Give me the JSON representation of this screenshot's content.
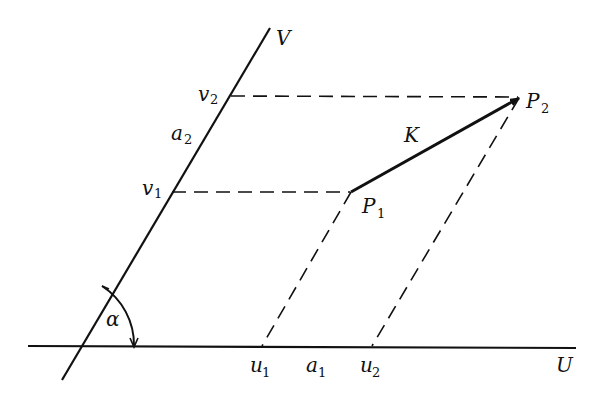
{
  "diagram": {
    "type": "oblique coordinate system",
    "axes": {
      "u_label": "U",
      "v_label": "V",
      "angle_label": "α"
    },
    "points": {
      "p1": {
        "base": "P",
        "sub": "1"
      },
      "p2": {
        "base": "P",
        "sub": "2"
      }
    },
    "vector_label": "K",
    "u_ticks": [
      {
        "base": "u",
        "sub": "1"
      },
      {
        "base": "a",
        "sub": "1"
      },
      {
        "base": "u",
        "sub": "2"
      }
    ],
    "v_ticks": [
      {
        "base": "v",
        "sub": "1"
      },
      {
        "base": "a",
        "sub": "2"
      },
      {
        "base": "v",
        "sub": "2"
      }
    ],
    "colors": {
      "ink": "#111111",
      "background": "#ffffff"
    }
  }
}
